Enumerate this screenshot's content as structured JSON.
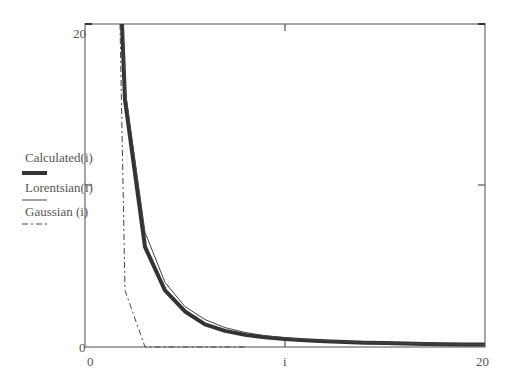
{
  "chart_data": {
    "type": "line",
    "title": "",
    "xlabel": "i",
    "ylabel": "",
    "xlim": [
      0,
      20
    ],
    "ylim": [
      0,
      20
    ],
    "x_ticks": [
      "0",
      "20"
    ],
    "y_ticks": [
      "0",
      "20"
    ],
    "grid": false,
    "legend_position": "left",
    "x": [
      2,
      3,
      4,
      5,
      6,
      7,
      8,
      9,
      10,
      11,
      12,
      13,
      14,
      15,
      16,
      17,
      18,
      19,
      20
    ],
    "series": [
      {
        "name": "Calculated(i)",
        "style": "thick-solid",
        "values": [
          15.3,
          6.2,
          3.5,
          2.2,
          1.4,
          1.0,
          0.75,
          0.6,
          0.5,
          0.42,
          0.36,
          0.31,
          0.27,
          0.24,
          0.21,
          0.19,
          0.17,
          0.16,
          0.15
        ]
      },
      {
        "name": "Lorentsian(i)",
        "style": "thin-solid",
        "values": [
          16.0,
          7.1,
          4.0,
          2.5,
          1.7,
          1.2,
          0.9,
          0.7,
          0.57,
          0.47,
          0.4,
          0.34,
          0.29,
          0.26,
          0.23,
          0.2,
          0.18,
          0.17,
          0.15
        ]
      },
      {
        "name": "Gaussian (i)",
        "style": "dash-dot",
        "values": [
          3.5,
          0.0,
          0.0,
          0.0,
          0.0,
          0.0,
          0.0,
          0.0,
          0.0,
          0.0,
          0.0,
          0.0,
          0.0,
          0.0,
          0.0,
          0.0,
          0.0,
          0.0,
          0.0
        ]
      }
    ]
  },
  "axis": {
    "y_top": "20",
    "y_bottom": "0",
    "x_left": "0",
    "x_right": "20",
    "x_var": "i"
  },
  "legend": {
    "items": [
      {
        "label": "Calculated(i)"
      },
      {
        "label": "Lorentsian(i)"
      },
      {
        "label": "Gaussian (i)"
      }
    ]
  },
  "colors": {
    "frame": "#777777",
    "curve": "#333333"
  }
}
